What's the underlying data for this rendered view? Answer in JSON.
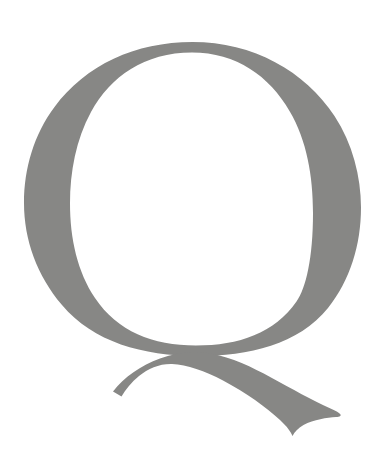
{
  "canvas": {
    "width": 390,
    "height": 458,
    "background_color": "#ffffff"
  },
  "glyph": {
    "character": "Q",
    "name": "letter-q",
    "description": "Uppercase letter Q, serif/old-style, with a large oval bowl and a long sweeping tail crossing the bowl at lower left and tapering to a point at lower right",
    "color": "#878785",
    "case": "uppercase",
    "style": "serif",
    "bowl": {
      "outer_left": 24,
      "outer_right": 361,
      "outer_top": 42,
      "outer_bottom": 356,
      "inner_left": 70,
      "inner_right": 313,
      "inner_top": 52,
      "inner_bottom": 326,
      "stroke_thin_top": 10,
      "stroke_thick_side": 47
    },
    "tail": {
      "start_x": 113,
      "start_y": 392,
      "cross_x": 185,
      "cross_y": 358,
      "end_x": 340,
      "end_y": 415,
      "lowest_y": 436,
      "max_thickness": 29
    }
  }
}
